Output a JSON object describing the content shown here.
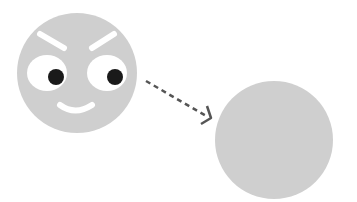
{
  "illustration": {
    "face": {
      "fill": "#cfcfcf",
      "cx": 77,
      "cy": 73,
      "r": 60,
      "eye_white": "#ffffff",
      "pupil": "#1a1a1a",
      "brow": "#ffffff",
      "mouth": "#ffffff"
    },
    "arrow": {
      "color": "#555555",
      "style": "dashed"
    },
    "blank_circle": {
      "fill": "#cfcfcf",
      "cx": 274,
      "cy": 140,
      "r": 59
    }
  }
}
